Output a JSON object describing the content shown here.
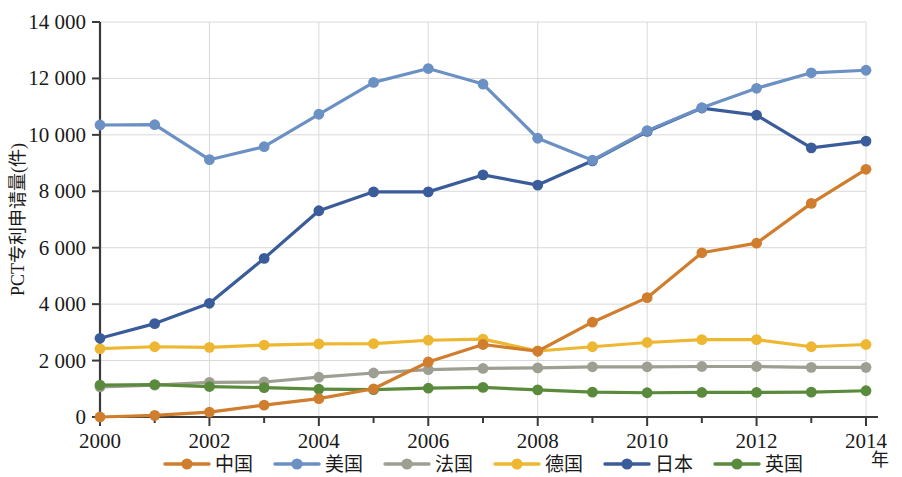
{
  "chart_data": {
    "type": "line",
    "title": "",
    "xlabel": "年",
    "ylabel": "PCT专利申请量(件)",
    "x": [
      2000,
      2001,
      2002,
      2003,
      2004,
      2005,
      2006,
      2007,
      2008,
      2009,
      2010,
      2011,
      2012,
      2013,
      2014
    ],
    "x_tick_labels": [
      "2000",
      "",
      "2002",
      "",
      "2004",
      "",
      "2006",
      "",
      "2008",
      "",
      "2010",
      "",
      "2012",
      "",
      "2014"
    ],
    "y_tick_labels": [
      "0",
      "2 000",
      "4 000",
      "6 000",
      "8 000",
      "10 000",
      "12 000",
      "14 000"
    ],
    "y_ticks": [
      0,
      2000,
      4000,
      6000,
      8000,
      10000,
      12000,
      14000
    ],
    "ylim": [
      0,
      14000
    ],
    "xlim": [
      2000,
      2014
    ],
    "grid": true,
    "legend_position": "bottom",
    "series": [
      {
        "name": "中国",
        "color": "#d07d2e",
        "values": [
          0,
          60,
          170,
          420,
          650,
          1000,
          1950,
          2570,
          2330,
          3360,
          4230,
          5820,
          6160,
          7570,
          8780
        ]
      },
      {
        "name": "美国",
        "color": "#6b90c4",
        "values": [
          10350,
          10360,
          9120,
          9580,
          10730,
          11860,
          12350,
          11800,
          9880,
          9100,
          10150,
          10960,
          11650,
          12200,
          12290
        ]
      },
      {
        "name": "法国",
        "color": "#9e9e92",
        "values": [
          1070,
          1130,
          1230,
          1240,
          1410,
          1560,
          1680,
          1720,
          1740,
          1780,
          1780,
          1790,
          1790,
          1760,
          1760
        ]
      },
      {
        "name": "德国",
        "color": "#edb731",
        "values": [
          2420,
          2490,
          2470,
          2550,
          2590,
          2600,
          2720,
          2760,
          2340,
          2490,
          2640,
          2740,
          2740,
          2490,
          2570
        ]
      },
      {
        "name": "日本",
        "color": "#3b5c9a",
        "values": [
          2790,
          3310,
          4030,
          5620,
          7310,
          7980,
          7980,
          8580,
          8220,
          9080,
          10120,
          10950,
          10700,
          9540,
          9780
        ]
      },
      {
        "name": "英国",
        "color": "#5a8a3c",
        "values": [
          1130,
          1150,
          1080,
          1040,
          990,
          970,
          1020,
          1050,
          960,
          880,
          860,
          870,
          870,
          880,
          930
        ]
      }
    ]
  }
}
